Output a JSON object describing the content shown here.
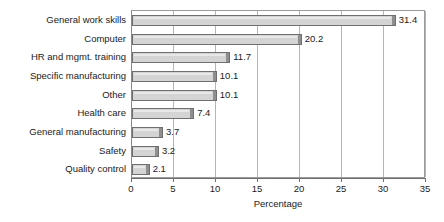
{
  "chart_data": {
    "type": "bar",
    "orientation": "horizontal",
    "title": "",
    "xlabel": "Percentage",
    "ylabel": "",
    "xlim": [
      0,
      35
    ],
    "xticks": [
      0,
      5,
      10,
      15,
      20,
      25,
      30,
      35
    ],
    "grid": "vertical",
    "legend": "none",
    "categories": [
      "General work skills",
      "Computer",
      "HR and mgmt. training",
      "Specific manufacturing",
      "Other",
      "Health care",
      "General manufacturing",
      "Safety",
      "Quality control"
    ],
    "values": [
      31.4,
      20.2,
      11.7,
      10.1,
      10.1,
      7.4,
      3.7,
      3.2,
      2.1
    ],
    "value_labels": [
      "31.4",
      "20.2",
      "11.7",
      "10.1",
      "10.1",
      "7.4",
      "3.7",
      "3.2",
      "2.1"
    ],
    "colors": {
      "bar_fill": "#d4d4d4",
      "bar_outline": "#6f6f6f",
      "bar_cap": "#8f8f8f",
      "gridline": "#b5b5b5",
      "axis": "#6f6f6f",
      "text": "#1a1a1a",
      "background": "#ffffff"
    }
  }
}
